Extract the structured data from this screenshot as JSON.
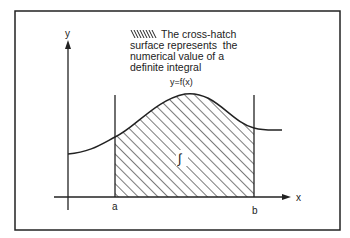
{
  "diagram": {
    "caption_lines": [
      "The cross-hatch",
      "surface represents  the",
      "numerical value of a",
      "definite integral"
    ],
    "curve_label": "y=f(x)",
    "y_axis_label": "y",
    "x_axis_label": "x",
    "lower_bound_label": "a",
    "upper_bound_label": "b",
    "integral_symbol": "∫",
    "colors": {
      "ink": "#222222",
      "background": "#ffffff"
    }
  }
}
